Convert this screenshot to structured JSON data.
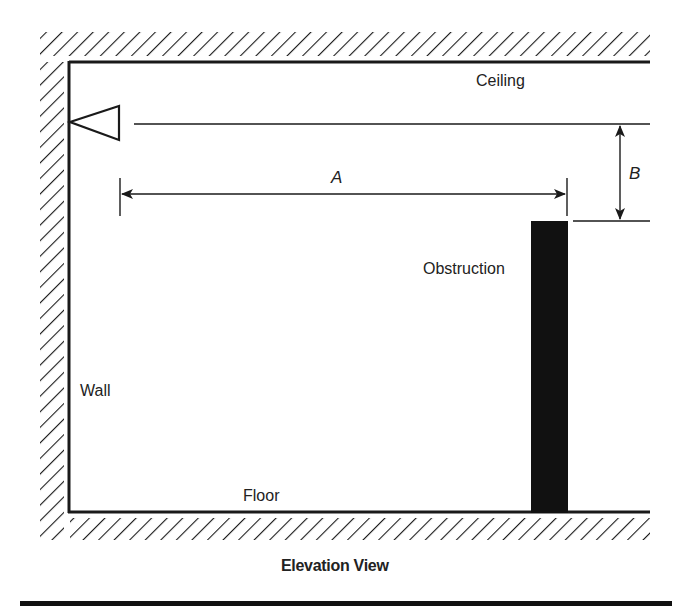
{
  "diagram": {
    "title": "Elevation View",
    "labels": {
      "ceiling": "Ceiling",
      "floor": "Floor",
      "wall": "Wall",
      "obstruction": "Obstruction",
      "dim_a": "A",
      "dim_b": "B"
    },
    "elements": [
      "ceiling-hatch",
      "wall-hatch",
      "floor-hatch",
      "detector-triangle",
      "obstruction-bar",
      "dimension-a",
      "dimension-b",
      "bottom-rule"
    ],
    "colors": {
      "line": "#1a1a1a",
      "fill": "#111111",
      "background": "#ffffff"
    }
  }
}
